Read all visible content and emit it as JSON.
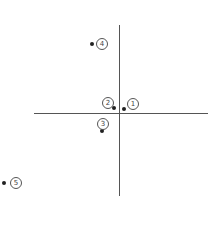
{
  "diagram": {
    "type": "coordinate-plane-points",
    "axis_color": "#555555",
    "points": [
      {
        "id": "1",
        "label": "1",
        "dot": {
          "x": 124,
          "y": 109
        },
        "label_pos": {
          "x": 127,
          "y": 98
        }
      },
      {
        "id": "2",
        "label": "2",
        "dot": {
          "x": 114,
          "y": 108
        },
        "label_pos": {
          "x": 102,
          "y": 97
        }
      },
      {
        "id": "3",
        "label": "3",
        "dot": {
          "x": 102,
          "y": 131
        },
        "label_pos": {
          "x": 97,
          "y": 118
        }
      },
      {
        "id": "4",
        "label": "4",
        "dot": {
          "x": 92,
          "y": 44
        },
        "label_pos": {
          "x": 96,
          "y": 38
        }
      },
      {
        "id": "5",
        "label": "5",
        "dot": {
          "x": 4,
          "y": 183
        },
        "label_pos": {
          "x": 10,
          "y": 177
        }
      }
    ]
  }
}
